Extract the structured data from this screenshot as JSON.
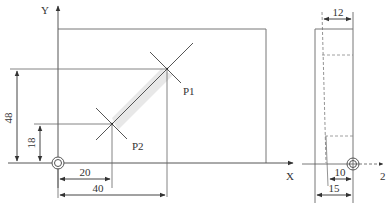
{
  "front_view": {
    "axis_labels": {
      "x": "X",
      "y": "Y"
    },
    "points": [
      {
        "name": "P1",
        "label": "P1"
      },
      {
        "name": "P2",
        "label": "P2"
      }
    ],
    "dimensions": {
      "p1_y": "48",
      "p2_y": "18",
      "p2_x": "20",
      "p1_x": "40"
    }
  },
  "side_view": {
    "axis_label": "Z",
    "axis_label_display": "2",
    "dimensions": {
      "top_width": "12",
      "bottom_inner": "10",
      "bottom_outer": "15"
    }
  },
  "colors": {
    "line": "#555555",
    "dim": "#444444",
    "highlight": "#dddddd"
  }
}
